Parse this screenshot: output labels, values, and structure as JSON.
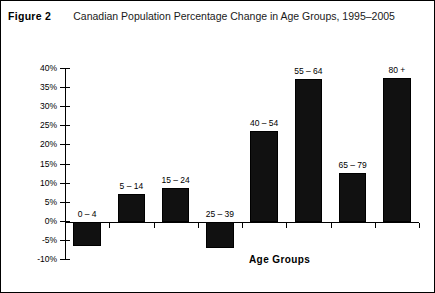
{
  "figure": {
    "label": "Figure 2",
    "title": "Canadian Population Percentage Change in Age Groups, 1995–2005"
  },
  "chart_data": {
    "type": "bar",
    "title": "Canadian Population Percentage Change in Age Groups, 1995–2005",
    "xlabel": "Age Groups",
    "ylabel": "",
    "ylim": [
      -10,
      40
    ],
    "grid": false,
    "legend": null,
    "categories": [
      "0 – 4",
      "5 – 14",
      "15 – 24",
      "25 – 39",
      "40 – 54",
      "55 – 64",
      "65 – 79",
      "80 +"
    ],
    "values": [
      -6.5,
      7,
      8.5,
      -7,
      23.5,
      37,
      12.5,
      37.5
    ],
    "yticks": [
      40,
      35,
      30,
      25,
      20,
      15,
      10,
      5,
      0,
      -5,
      -10
    ],
    "ytick_labels": [
      "40%",
      "35%",
      "30%",
      "25%",
      "20%",
      "15%",
      "10%",
      "5%",
      "0%",
      "-5%",
      "-10%"
    ],
    "bar_color": "#111111"
  }
}
